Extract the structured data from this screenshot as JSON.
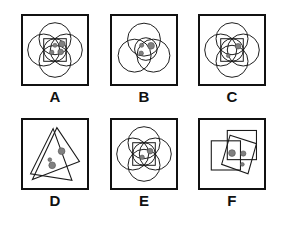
{
  "figure": {
    "title": "",
    "background_color": "#ffffff",
    "stroke_color": "#1a1a1a",
    "dot_color": "#808080",
    "dot_stroke_color": "#4d4d4d",
    "label_color": "#111111",
    "rows": 2,
    "columns": 3
  },
  "panels": [
    {
      "label": "A",
      "shape_type": "circles",
      "shape_count": 4,
      "has_square": true,
      "has_inner_circle": true,
      "dot_count": 4,
      "dots": [
        {
          "cx": 34,
          "cy": 31,
          "r": 2.2
        },
        {
          "cx": 41.5,
          "cy": 29.5,
          "r": 3.2
        },
        {
          "cx": 30.5,
          "cy": 38.5,
          "r": 2.4
        },
        {
          "cx": 40,
          "cy": 38,
          "r": 3.0
        }
      ]
    },
    {
      "label": "B",
      "shape_type": "circles",
      "shape_count": 3,
      "has_square": false,
      "has_inner_circle": true,
      "dot_count": 3,
      "dots": [
        {
          "cx": 31.5,
          "cy": 31,
          "r": 2.2
        },
        {
          "cx": 41.5,
          "cy": 31.5,
          "r": 3.6
        },
        {
          "cx": 31,
          "cy": 39.5,
          "r": 2.4
        }
      ]
    },
    {
      "label": "C",
      "shape_type": "circles",
      "shape_count": 4,
      "has_square": true,
      "has_inner_circle": true,
      "dot_count": 2,
      "dots": [
        {
          "cx": 40.5,
          "cy": 32,
          "r": 3.0
        },
        {
          "cx": 30,
          "cy": 42,
          "r": 2.0
        }
      ]
    },
    {
      "label": "D",
      "shape_type": "triangles",
      "shape_count": 2,
      "has_square": false,
      "has_inner_circle": false,
      "dot_count": 3,
      "dots": [
        {
          "cx": 41,
          "cy": 33,
          "r": 3.6
        },
        {
          "cx": 28.5,
          "cy": 42,
          "r": 2.0
        },
        {
          "cx": 31,
          "cy": 48,
          "r": 3.6
        }
      ]
    },
    {
      "label": "E",
      "shape_type": "circles",
      "shape_count": 4,
      "has_square": true,
      "has_inner_circle": true,
      "dot_count": 2,
      "dots": [
        {
          "cx": 40.5,
          "cy": 33,
          "r": 3.0
        },
        {
          "cx": 32,
          "cy": 39.5,
          "r": 2.4
        }
      ]
    },
    {
      "label": "F",
      "shape_type": "squares",
      "shape_count": 3,
      "has_square": false,
      "has_inner_circle": false,
      "dot_count": 3,
      "dots": [
        {
          "cx": 34,
          "cy": 35,
          "r": 3.6
        },
        {
          "cx": 46,
          "cy": 35.5,
          "r": 2.8
        },
        {
          "cx": 45,
          "cy": 47,
          "r": 2.0
        }
      ]
    }
  ]
}
